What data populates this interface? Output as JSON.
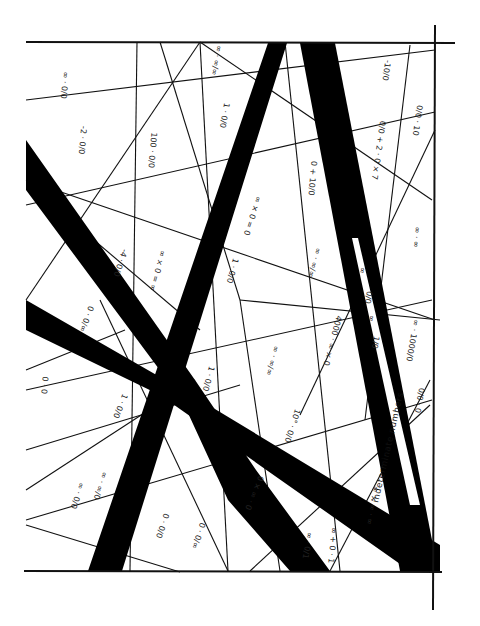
{
  "artwork": {
    "banner_text": "indeterminate numbers",
    "colors": {
      "ink": "#000000",
      "paper": "#ffffff",
      "line": "#111111"
    },
    "expressions": [
      {
        "id": "e1",
        "text": "∞ · 0/0",
        "x": 62,
        "y": 85,
        "rot": 95
      },
      {
        "id": "e2",
        "text": "-2 · 0/0",
        "x": 80,
        "y": 140,
        "rot": 95
      },
      {
        "id": "e3",
        "text": "100 · 0/0",
        "x": 150,
        "y": 150,
        "rot": 95
      },
      {
        "id": "e4",
        "text": "∞ · ∞/∞",
        "x": 214,
        "y": 60,
        "rot": 100
      },
      {
        "id": "e5",
        "text": "1 · 0/0",
        "x": 222,
        "y": 115,
        "rot": 100
      },
      {
        "id": "e6",
        "text": "∞ × 0 = 0",
        "x": 250,
        "y": 215,
        "rot": 108
      },
      {
        "id": "e7",
        "text": "0 + 10/0",
        "x": 310,
        "y": 178,
        "rot": 95
      },
      {
        "id": "e8",
        "text": "0/0 + 2 · 0 × 7",
        "x": 376,
        "y": 150,
        "rot": 98
      },
      {
        "id": "e9",
        "text": "-10/0",
        "x": 384,
        "y": 70,
        "rot": 98
      },
      {
        "id": "e10",
        "text": "0/0 · 10",
        "x": 415,
        "y": 120,
        "rot": 98
      },
      {
        "id": "e11",
        "text": "-4 · 0/0",
        "x": 118,
        "y": 262,
        "rot": 108
      },
      {
        "id": "e12",
        "text": "∞ × 0 = ∞",
        "x": 155,
        "y": 270,
        "rot": 105
      },
      {
        "id": "e13",
        "text": "1 · 0/0",
        "x": 230,
        "y": 270,
        "rot": 105
      },
      {
        "id": "e14",
        "text": "∞ · ∞/∞",
        "x": 312,
        "y": 262,
        "rot": 105
      },
      {
        "id": "e15",
        "text": "∞ · ∞",
        "x": 414,
        "y": 237,
        "rot": 95
      },
      {
        "id": "e16",
        "text": "0 · 0/∞",
        "x": 84,
        "y": 318,
        "rot": 110
      },
      {
        "id": "e17",
        "text": "1 · 0/0",
        "x": 206,
        "y": 378,
        "rot": 105
      },
      {
        "id": "e18",
        "text": "∞ · ∞/∞",
        "x": 270,
        "y": 360,
        "rot": 105
      },
      {
        "id": "e19",
        "text": "4000 · ∞ × 0",
        "x": 330,
        "y": 340,
        "rot": 105
      },
      {
        "id": "e20",
        "text": "∞ · 1000/0",
        "x": 410,
        "y": 340,
        "rot": 100
      },
      {
        "id": "e21",
        "text": "0 · 0",
        "x": 42,
        "y": 385,
        "rot": 95
      },
      {
        "id": "e22",
        "text": "1 · 0/0",
        "x": 118,
        "y": 405,
        "rot": 112
      },
      {
        "id": "e23",
        "text": "10° · 0/0",
        "x": 290,
        "y": 425,
        "rot": 108
      },
      {
        "id": "e24",
        "text": "0/0 · 0",
        "x": 417,
        "y": 400,
        "rot": 100
      },
      {
        "id": "e25",
        "text": "0 × ∞ · 0",
        "x": 252,
        "y": 492,
        "rot": 112
      },
      {
        "id": "e26",
        "text": "∞ · 0/0",
        "x": 75,
        "y": 495,
        "rot": 108
      },
      {
        "id": "e27",
        "text": "∞ · ∞/0",
        "x": 98,
        "y": 485,
        "rot": 108
      },
      {
        "id": "e28",
        "text": "0 · 0/0",
        "x": 160,
        "y": 525,
        "rot": 108
      },
      {
        "id": "e29",
        "text": "0 · 0/∞",
        "x": 196,
        "y": 535,
        "rot": 108
      },
      {
        "id": "e30",
        "text": "∞ · 0/1",
        "x": 305,
        "y": 545,
        "rot": 100
      },
      {
        "id": "e31",
        "text": "∞ + 0 · 1",
        "x": 330,
        "y": 545,
        "rot": 95
      },
      {
        "id": "e32",
        "text": "∞ × ∞ · ∞",
        "x": 370,
        "y": 505,
        "rot": 100
      }
    ],
    "banner_marks": [
      {
        "text": "∞",
        "x": 360,
        "y": 270,
        "rot": 100
      },
      {
        "text": "0/0",
        "x": 366,
        "y": 297,
        "rot": 100
      },
      {
        "text": "∞",
        "x": 369,
        "y": 318,
        "rot": 100
      },
      {
        "text": "1/0",
        "x": 373,
        "y": 342,
        "rot": 100
      }
    ]
  }
}
